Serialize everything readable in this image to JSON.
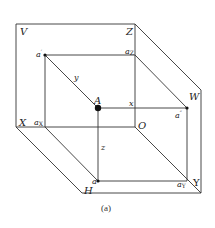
{
  "diagram": {
    "type": "three-projection-planes",
    "caption": "(a)",
    "planes": {
      "V": "V",
      "H": "H",
      "W": "W"
    },
    "axes": {
      "X": "X",
      "Y": "Y",
      "Z": "Z",
      "O": "O"
    },
    "point": {
      "A": "A",
      "a_prime": "a",
      "a_prime_mark": "′",
      "a_double_prime": "a",
      "a_double_prime_mark": "″",
      "a": "a"
    },
    "axis_points": {
      "aX": "a",
      "aX_sub": "X",
      "aY": "a",
      "aY_sub": "Y",
      "aZ": "a",
      "aZ_sub": "Z"
    },
    "distances": {
      "x": "x",
      "y": "y",
      "z": "z"
    }
  }
}
